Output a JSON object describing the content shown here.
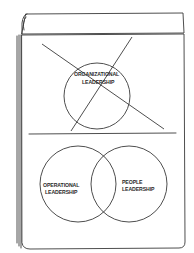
{
  "sketch": {
    "type": "flip chart drawing",
    "stroke_color": "#3a3a3a",
    "background": "#ffffff"
  },
  "top_panel": {
    "circle_label_line1": "ORGANIZATIONAL",
    "circle_label_line2": "LEADERSHIP",
    "crossed_out": true
  },
  "bottom_panel": {
    "venn": {
      "left_label_line1": "OPERATIONAL",
      "left_label_line2": "LEADERSHIP",
      "right_label_line1": "PEOPLE",
      "right_label_line2": "LEADERSHIP"
    }
  }
}
